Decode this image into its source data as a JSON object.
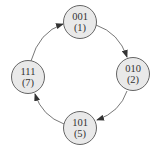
{
  "diagram": {
    "type": "state-cycle",
    "nodes": [
      {
        "id": "n1",
        "binary": "001",
        "decimal": "(1)",
        "cx": 80,
        "cy": 22
      },
      {
        "id": "n2",
        "binary": "010",
        "decimal": "(2)",
        "cx": 133,
        "cy": 74
      },
      {
        "id": "n5",
        "binary": "101",
        "decimal": "(5)",
        "cx": 80,
        "cy": 128
      },
      {
        "id": "n7",
        "binary": "111",
        "decimal": "(7)",
        "cx": 28,
        "cy": 77
      }
    ],
    "edges": [
      {
        "from": "001",
        "to": "010"
      },
      {
        "from": "010",
        "to": "101"
      },
      {
        "from": "101",
        "to": "111"
      },
      {
        "from": "111",
        "to": "001"
      }
    ],
    "colors": {
      "node_fill": "#e9e9e9",
      "stroke": "#555555",
      "text": "#333333"
    }
  }
}
